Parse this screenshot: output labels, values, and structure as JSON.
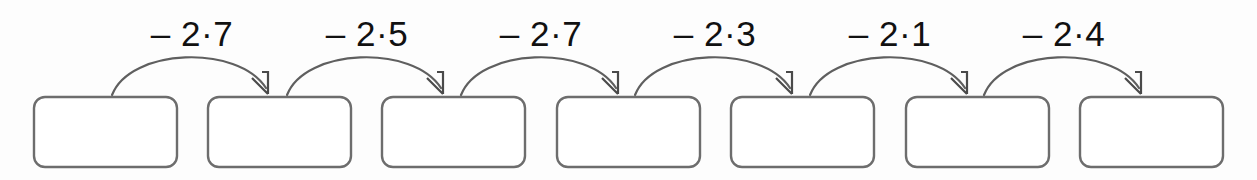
{
  "worksheet": {
    "type": "subtraction-chain-diagram",
    "description": "Chain of seven empty answer boxes joined by six curved subtraction arrows",
    "box_count": 7,
    "arrow_count": 6,
    "colors": {
      "background": "#fdfdfd",
      "box_stroke": "#6d6d6d",
      "box_fill": "#ffffff",
      "arrow_stroke": "#5f5f5f",
      "label_text": "#111111"
    },
    "boxes": [
      {
        "id": "box-1",
        "value": "",
        "x": 34,
        "y": 97,
        "w": 143,
        "h": 70
      },
      {
        "id": "box-2",
        "value": "",
        "x": 208,
        "y": 97,
        "w": 143,
        "h": 70
      },
      {
        "id": "box-3",
        "value": "",
        "x": 382,
        "y": 97,
        "w": 143,
        "h": 70
      },
      {
        "id": "box-4",
        "value": "",
        "x": 557,
        "y": 97,
        "w": 143,
        "h": 70
      },
      {
        "id": "box-5",
        "value": "",
        "x": 731,
        "y": 97,
        "w": 143,
        "h": 70
      },
      {
        "id": "box-6",
        "value": "",
        "x": 906,
        "y": 97,
        "w": 143,
        "h": 70
      },
      {
        "id": "box-7",
        "value": "",
        "x": 1080,
        "y": 97,
        "w": 143,
        "h": 70
      }
    ],
    "arrows": [
      {
        "id": "arrow-1",
        "label": "– 2·7",
        "from": "box-1",
        "to": "box-2",
        "label_x": 192,
        "x_start": 112,
        "x_end": 267,
        "apex_y": 54
      },
      {
        "id": "arrow-2",
        "label": "– 2·5",
        "from": "box-2",
        "to": "box-3",
        "label_x": 367,
        "x_start": 287,
        "x_end": 441,
        "apex_y": 54
      },
      {
        "id": "arrow-3",
        "label": "– 2·7",
        "from": "box-3",
        "to": "box-4",
        "label_x": 541,
        "x_start": 461,
        "x_end": 616,
        "apex_y": 54
      },
      {
        "id": "arrow-4",
        "label": "– 2·3",
        "from": "box-4",
        "to": "box-5",
        "label_x": 715,
        "x_start": 635,
        "x_end": 790,
        "apex_y": 54
      },
      {
        "id": "arrow-5",
        "label": "– 2·1",
        "from": "box-5",
        "to": "box-6",
        "label_x": 890,
        "x_start": 810,
        "x_end": 965,
        "apex_y": 54
      },
      {
        "id": "arrow-6",
        "label": "– 2·4",
        "from": "box-6",
        "to": "box-7",
        "label_x": 1064,
        "x_start": 984,
        "x_end": 1139,
        "apex_y": 54
      }
    ]
  }
}
